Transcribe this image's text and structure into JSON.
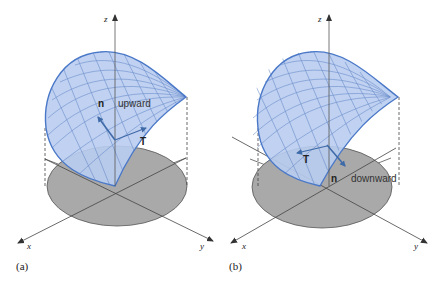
{
  "figure": {
    "colors": {
      "surface_fill": "#b9cdf0",
      "surface_stroke": "#4a78c8",
      "mesh": "#5a82c4",
      "region_fill": "#a9a9a9",
      "axis": "#444444",
      "vector": "#3f6aa8"
    },
    "panels": [
      {
        "id": "a",
        "label": "(a)",
        "axes": {
          "x": "x",
          "y": "y",
          "z": "z"
        },
        "normal_label": "n",
        "tangent_label": "T",
        "orientation_label": "upward"
      },
      {
        "id": "b",
        "label": "(b)",
        "axes": {
          "x": "x",
          "y": "y",
          "z": "z"
        },
        "normal_label": "n",
        "tangent_label": "T",
        "orientation_label": "downward"
      }
    ]
  }
}
